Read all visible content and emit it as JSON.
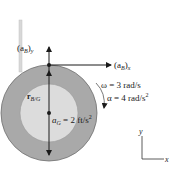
{
  "diagram": {
    "type": "rigid-body-kinematics",
    "colors": {
      "outer_ring": "#a9a9a9",
      "inner_disk": "#dcdcdc",
      "rope": "#d8d8d8",
      "ink": "#1a1a1a"
    },
    "labels": {
      "aB_y": {
        "base": "(a",
        "sub": "B",
        "close": ")",
        "axis": "y"
      },
      "aB_x": {
        "base": "(a",
        "sub": "B",
        "close": ")",
        "axis": "x"
      },
      "r_BG": {
        "base": "r",
        "sub": "B/G"
      },
      "omega": "ω = 3 rad/s",
      "alpha": "α = 4 rad/s",
      "alpha_exp": "2",
      "aG_base": "a",
      "aG_sub": "G",
      "aG_value": " = 2 ft/s",
      "aG_exp": "2",
      "axis_y": "y",
      "axis_x": "x"
    }
  }
}
